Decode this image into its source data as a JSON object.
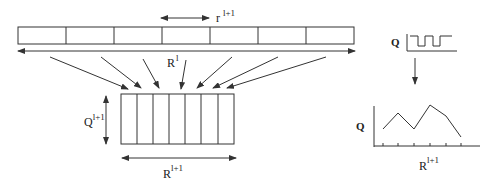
{
  "labels": {
    "r_base": "r",
    "r_sup": "l+1",
    "R_top_base": "R",
    "R_top_sup": "l",
    "Q_box_base": "Q",
    "Q_box_sup": "l+1",
    "R_box_base": "R",
    "R_box_sup": "l+1",
    "Q_signal": "Q",
    "Q_plot": "Q",
    "R_plot_base": "R",
    "R_plot_sup": "l+1"
  },
  "top_strip": {
    "cell_count": 7
  },
  "lower_box": {
    "column_count": 7
  },
  "colors": {
    "stroke": "#333333",
    "background": "#ffffff"
  }
}
